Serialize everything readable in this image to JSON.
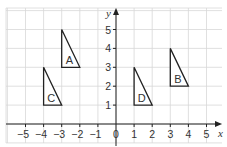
{
  "diagram": {
    "type": "coordinate-grid",
    "x_axis": {
      "label": "x",
      "ticks": [
        "−5",
        "−4",
        "−3",
        "−2",
        "−1",
        "0",
        "1",
        "2",
        "3",
        "4",
        "5"
      ],
      "values": [
        -5,
        -4,
        -3,
        -2,
        -1,
        0,
        1,
        2,
        3,
        4,
        5
      ]
    },
    "y_axis": {
      "label": "y",
      "ticks": [
        "1",
        "2",
        "3",
        "4",
        "5"
      ],
      "values": [
        1,
        2,
        3,
        4,
        5
      ]
    },
    "triangles": [
      {
        "label": "A",
        "vertices": [
          [
            -3,
            3
          ],
          [
            -3,
            5
          ],
          [
            -2,
            3
          ]
        ]
      },
      {
        "label": "B",
        "vertices": [
          [
            3,
            2
          ],
          [
            3,
            4
          ],
          [
            4,
            2
          ]
        ]
      },
      {
        "label": "C",
        "vertices": [
          [
            -4,
            1
          ],
          [
            -4,
            3
          ],
          [
            -3,
            1
          ]
        ]
      },
      {
        "label": "D",
        "vertices": [
          [
            1,
            1
          ],
          [
            1,
            3
          ],
          [
            2,
            1
          ]
        ]
      }
    ]
  }
}
